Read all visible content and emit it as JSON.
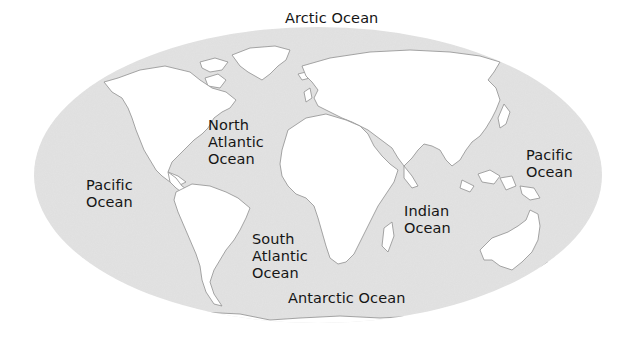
{
  "map": {
    "projection": "oval world map",
    "colors": {
      "ocean": "#e3e3e3",
      "land": "#ffffff",
      "coast": "#9a9a9a",
      "label": "#151515",
      "background": "#ffffff"
    },
    "labels": {
      "arctic": {
        "lines": [
          "Arctic Ocean"
        ]
      },
      "north_atlantic": {
        "lines": [
          "North",
          "Atlantic",
          "Ocean"
        ]
      },
      "pacific_west": {
        "lines": [
          "Pacific",
          "Ocean"
        ]
      },
      "pacific_east": {
        "lines": [
          "Pacific",
          "Ocean"
        ]
      },
      "south_atlantic": {
        "lines": [
          "South",
          "Atlantic",
          "Ocean"
        ]
      },
      "indian": {
        "lines": [
          "Indian",
          "Ocean"
        ]
      },
      "antarctic": {
        "lines": [
          "Antarctic Ocean"
        ]
      }
    }
  }
}
